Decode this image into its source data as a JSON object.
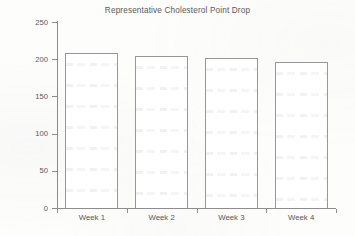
{
  "chart_data": {
    "type": "bar",
    "title": "Representative Cholesterol Point Drop",
    "xlabel": "",
    "ylabel": "Cholesterol",
    "categories": [
      "Week 1",
      "Week 2",
      "Week 3",
      "Week 4"
    ],
    "values": [
      208,
      204,
      201,
      196
    ],
    "ylim": [
      0,
      250
    ],
    "yticks": [
      0,
      50,
      100,
      150,
      200,
      250
    ],
    "ytick_labels": [
      "0",
      "50",
      "100",
      "150",
      "200",
      "250"
    ],
    "grid": false,
    "legend": null,
    "bar_facecolor": "#ffffff",
    "bar_edgecolor": "#97979b",
    "axis_color": "#8d8d90",
    "text_color": "#58585a"
  }
}
